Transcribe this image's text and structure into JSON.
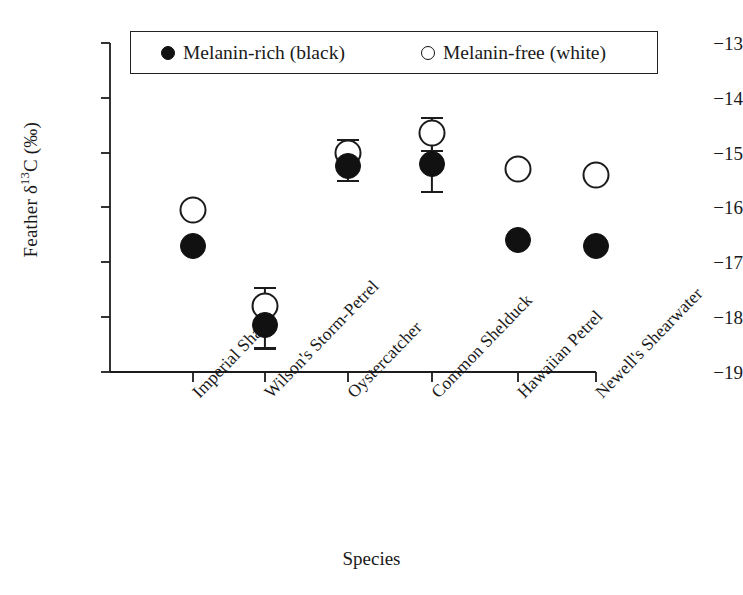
{
  "chart_data": {
    "type": "scatter",
    "title": "",
    "xlabel": "Species",
    "ylabel": "Feather δ13C (‰)",
    "ylabel_parts": {
      "prefix": "Feather δ",
      "superscript": "13",
      "suffix": "C (‰)"
    },
    "ylim": [
      -19,
      -13
    ],
    "yticks": [
      -13,
      -14,
      -15,
      -16,
      -17,
      -18,
      -19
    ],
    "ytick_labels": [
      "−13",
      "−14",
      "−15",
      "−16",
      "−17",
      "−18",
      "−19"
    ],
    "grid": false,
    "legend_position": "top-inside",
    "categories": [
      "Imperial Shag",
      "Wilson's Storm-Petrel",
      "Oystercatcher",
      "Common Shelduck",
      "Hawaiian Petrel",
      "Newell's Shearwater"
    ],
    "series": [
      {
        "name": "Melanin-rich (black)",
        "marker": "filled-circle",
        "color": "#111111",
        "values": [
          -16.7,
          -18.15,
          -15.25,
          -15.2,
          -16.6,
          -16.7
        ],
        "errors": [
          null,
          0.4,
          0.25,
          0.5,
          null,
          null
        ]
      },
      {
        "name": "Melanin-free (white)",
        "marker": "open-circle",
        "color": "#ffffff",
        "values": [
          -16.05,
          -17.8,
          -15.0,
          -14.65,
          -15.3,
          -15.4
        ],
        "errors": [
          null,
          0.35,
          0.25,
          0.3,
          null,
          null
        ]
      }
    ]
  },
  "legend": {
    "entries": [
      {
        "label": "Melanin-rich (black)",
        "marker": "filled-circle"
      },
      {
        "label": "Melanin-free (white)",
        "marker": "open-circle"
      }
    ]
  },
  "colors": {
    "axis": "#1c1c1c",
    "filled_marker": "#111111",
    "open_marker_stroke": "#1c1c1c",
    "background": "#ffffff"
  }
}
